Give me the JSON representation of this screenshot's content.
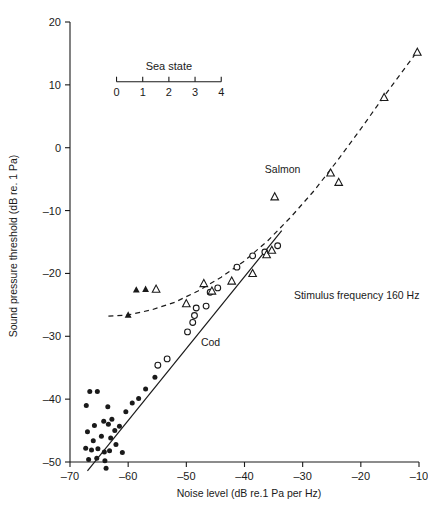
{
  "chart_data": {
    "type": "scatter",
    "title": "",
    "xlabel": "Noise level (dB re.1 Pa per Hz)",
    "ylabel": "Sound pressure threshold (dB re. 1 Pa)",
    "xlim": [
      -70,
      -10
    ],
    "ylim": [
      -50,
      20
    ],
    "xticks": [
      -70,
      -60,
      -50,
      -40,
      -30,
      -20,
      -10
    ],
    "xticklabels": [
      "–70",
      "–60",
      "–50",
      "–40",
      "–30",
      "–20",
      "–10"
    ],
    "yticks": [
      -50,
      -40,
      -30,
      -20,
      -10,
      0,
      10,
      20
    ],
    "yticklabels": [
      "–50",
      "–40",
      "–30",
      "–20",
      "–10",
      "0",
      "10",
      "20"
    ],
    "grid": false,
    "legend_position": "inline-annotations",
    "secondary_axis": {
      "label": "Sea  state",
      "ticks": [
        0,
        1,
        2,
        3,
        4
      ],
      "ticklabels": [
        "0",
        "1",
        "2",
        "3",
        "4"
      ],
      "x_range_db": [
        -62.0,
        -44.0
      ],
      "y_value_db": 10.5
    },
    "annotations": [
      {
        "text": "Salmon",
        "x": -36.5,
        "y": -4.0
      },
      {
        "text": "Cod",
        "x": -47.5,
        "y": -31.5
      },
      {
        "text": "Stimulus frequency 160 Hz",
        "x": -31.5,
        "y": -24.0
      }
    ],
    "series": [
      {
        "name": "Cod filled circles",
        "marker": "filled-circle",
        "points": [
          [
            -66.6,
            -38.8
          ],
          [
            -65.3,
            -38.8
          ],
          [
            -67.2,
            -41.0
          ],
          [
            -63.5,
            -41.2
          ],
          [
            -65.8,
            -44.2
          ],
          [
            -64.2,
            -43.5
          ],
          [
            -63.4,
            -44.0
          ],
          [
            -62.8,
            -43.2
          ],
          [
            -67.0,
            -45.2
          ],
          [
            -66.0,
            -46.6
          ],
          [
            -64.6,
            -45.9
          ],
          [
            -63.0,
            -46.2
          ],
          [
            -62.3,
            -45.0
          ],
          [
            -61.5,
            -44.3
          ],
          [
            -67.3,
            -47.8
          ],
          [
            -66.3,
            -48.1
          ],
          [
            -65.2,
            -47.9
          ],
          [
            -64.1,
            -48.4
          ],
          [
            -63.2,
            -48.2
          ],
          [
            -62.1,
            -47.2
          ],
          [
            -61.0,
            -48.5
          ],
          [
            -66.8,
            -49.6
          ],
          [
            -65.4,
            -49.4
          ],
          [
            -64.0,
            -49.8
          ],
          [
            -63.8,
            -51.0
          ],
          [
            -60.4,
            -42.0
          ],
          [
            -59.3,
            -40.6
          ],
          [
            -58.2,
            -39.9
          ],
          [
            -57.0,
            -38.4
          ],
          [
            -55.4,
            -36.5
          ]
        ]
      },
      {
        "name": "Cod open circles",
        "marker": "open-circle",
        "points": [
          [
            -54.9,
            -34.6
          ],
          [
            -53.3,
            -33.6
          ],
          [
            -49.8,
            -29.3
          ],
          [
            -48.9,
            -27.8
          ],
          [
            -48.6,
            -26.7
          ],
          [
            -48.3,
            -25.5
          ],
          [
            -46.6,
            -25.2
          ],
          [
            -45.9,
            -23.0
          ],
          [
            -44.6,
            -22.3
          ],
          [
            -41.3,
            -19.0
          ],
          [
            -38.6,
            -17.2
          ],
          [
            -36.5,
            -16.6
          ],
          [
            -34.3,
            -15.6
          ]
        ]
      },
      {
        "name": "Salmon filled triangles",
        "marker": "filled-triangle",
        "points": [
          [
            -60.0,
            -26.6
          ],
          [
            -58.6,
            -22.6
          ],
          [
            -57.0,
            -22.5
          ]
        ]
      },
      {
        "name": "Salmon open triangles",
        "marker": "open-triangle",
        "points": [
          [
            -55.2,
            -22.5
          ],
          [
            -50.0,
            -24.8
          ],
          [
            -47.0,
            -21.6
          ],
          [
            -45.6,
            -22.8
          ],
          [
            -42.2,
            -21.2
          ],
          [
            -38.6,
            -20.0
          ],
          [
            -36.2,
            -17.0
          ],
          [
            -35.3,
            -16.3
          ],
          [
            -34.8,
            -7.8
          ],
          [
            -25.2,
            -4.0
          ],
          [
            -23.8,
            -5.5
          ],
          [
            -16.0,
            8.0
          ],
          [
            -10.3,
            15.2
          ]
        ]
      }
    ],
    "fits": [
      {
        "name": "Cod regression (solid line)",
        "style": "solid",
        "x0": -67.0,
        "y0": -51.4,
        "x1": -33.6,
        "y1": -13.2
      },
      {
        "name": "Salmon fit (dashed curve)",
        "style": "dashed",
        "points": [
          [
            -63.4,
            -26.8
          ],
          [
            -60.0,
            -26.6
          ],
          [
            -56.0,
            -25.8
          ],
          [
            -52.0,
            -24.6
          ],
          [
            -48.0,
            -22.8
          ],
          [
            -44.0,
            -20.6
          ],
          [
            -40.0,
            -18.0
          ],
          [
            -36.0,
            -14.8
          ],
          [
            -32.0,
            -11.0
          ],
          [
            -28.0,
            -6.8
          ],
          [
            -24.0,
            -2.0
          ],
          [
            -20.0,
            3.0
          ],
          [
            -16.0,
            8.2
          ],
          [
            -12.0,
            13.2
          ],
          [
            -10.2,
            15.4
          ]
        ]
      }
    ]
  }
}
